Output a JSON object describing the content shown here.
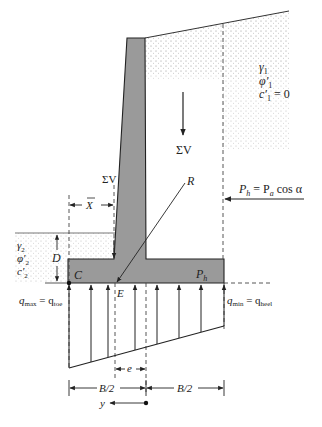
{
  "diagram": {
    "colors": {
      "concrete": "#9a9a9a",
      "soil_dots": "#c8c8c8",
      "line": "#222222",
      "background": "#ffffff"
    },
    "backfill": {
      "gamma": "γ",
      "gamma_sub": "1",
      "phi": "φ′",
      "phi_sub": "1",
      "c": "c′",
      "c_sub": "1",
      "c_value": " = 0"
    },
    "foundation_soil": {
      "gamma": "γ",
      "gamma_sub": "2",
      "phi": "φ′",
      "phi_sub": "2",
      "c": "c′",
      "c_sub": "2"
    },
    "forces": {
      "sum_v_main": "ΣV",
      "sum_v_stem": "ΣV",
      "resultant": "R",
      "ph_eq_lhs": "P",
      "ph_eq_lhs_sub": "h",
      "ph_eq_mid": " = P",
      "ph_eq_mid_sub": "a",
      "ph_eq_rhs": " cos α",
      "ph_base": "P",
      "ph_base_sub": "h"
    },
    "points": {
      "toe_point": "C",
      "resultant_point": "E"
    },
    "dimensions": {
      "x_bar": "X",
      "depth": "D",
      "eccentricity": "e",
      "half_base_left": "B/2",
      "half_base_right": "B/2",
      "y_axis": "y"
    },
    "pressures": {
      "qmax_lhs": "q",
      "qmax_lhs_sub": "max",
      "qmax_rhs": " = q",
      "qmax_rhs_sub": "toe",
      "qmin_lhs": "q",
      "qmin_lhs_sub": "min",
      "qmin_rhs": " = q",
      "qmin_rhs_sub": "heel"
    }
  }
}
